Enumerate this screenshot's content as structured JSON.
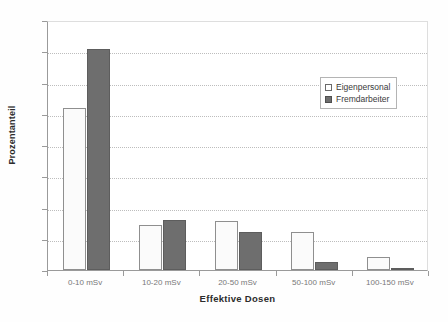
{
  "chart_data": {
    "type": "bar",
    "title": "",
    "xlabel": "Effektive Dosen",
    "ylabel": "Prozentanteil",
    "categories": [
      "0-10 mSv",
      "10-20 mSv",
      "20-50 mSv",
      "50-100 mSv",
      "100-150 mSv"
    ],
    "series": [
      {
        "name": "Eigenpersonal",
        "color": "#fbfbfb",
        "values": [
          51.7,
          14.3,
          15.8,
          12.2,
          4.3
        ]
      },
      {
        "name": "Fremdarbeiter",
        "color": "#6e6e6e",
        "values": [
          70.7,
          16.0,
          12.3,
          2.5,
          0.5
        ]
      }
    ],
    "ylim": [
      0,
      80
    ],
    "yticks": [
      0,
      10,
      20,
      30,
      40,
      50,
      60,
      70,
      80
    ],
    "ytick_labels": [
      "0",
      "10",
      "20",
      "30",
      "40",
      "50",
      "60",
      "70",
      "80"
    ],
    "grid": "horizontal-dotted",
    "legend_position": "upper-right-inside"
  },
  "legend": {
    "entries": [
      {
        "label": "Eigenpersonal",
        "swatch": "light"
      },
      {
        "label": "Fremdarbeiter",
        "swatch": "dark"
      }
    ]
  }
}
